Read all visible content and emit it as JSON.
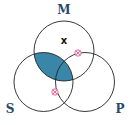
{
  "diagram": {
    "type": "venn-3",
    "sets": [
      {
        "id": "M",
        "label": "M"
      },
      {
        "id": "S",
        "label": "S"
      },
      {
        "id": "P",
        "label": "P"
      }
    ],
    "shaded_region": "S∩M outside P and S∩M∩P",
    "shaded_description": "Region of M overlapping S (all of S∩M) is shaded",
    "x_mark": {
      "symbol": "x",
      "region": "M only"
    },
    "markers": [
      {
        "symbol": "⊗",
        "region": "on M–P boundary (M∩P, outside S)"
      },
      {
        "symbol": "⊗",
        "region": "on S–P boundary below M"
      }
    ],
    "colors": {
      "shade": "#3a86a8",
      "line": "#222222",
      "label": "#2a4a6b",
      "marker": "#d9558a"
    }
  }
}
